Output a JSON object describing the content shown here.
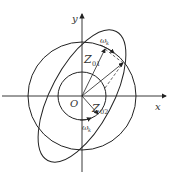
{
  "diagram": {
    "axes": {
      "x_label": "x",
      "y_label": "y",
      "origin_label": "O"
    },
    "labels": {
      "z01_main": "Z",
      "z01_sub": "01",
      "z02_main": "Z",
      "z02_sub": "02",
      "omega_top": "ω",
      "omega_top_sub": "k",
      "omega_bottom": "ω",
      "omega_bottom_sub": "k"
    },
    "shapes": {
      "outer_circle": {
        "cx": 82,
        "cy": 96,
        "r": 54
      },
      "inner_circle": {
        "cx": 82,
        "cy": 96,
        "r": 24
      },
      "ellipse": {
        "cx": 82,
        "cy": 96,
        "rx": 73,
        "ry": 31,
        "rotation_deg": -62
      }
    },
    "colors": {
      "stroke": "#222222",
      "background": "#ffffff"
    }
  }
}
